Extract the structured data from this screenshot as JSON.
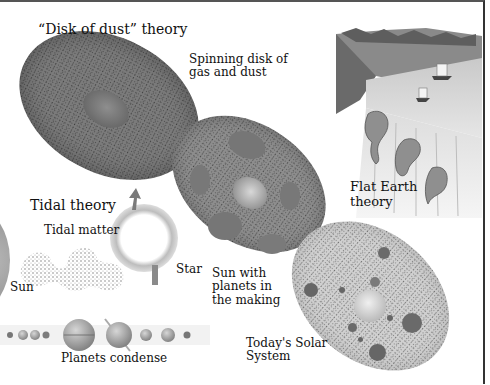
{
  "diagram": {
    "labels": {
      "disk_of_dust_theory": "“Disk of dust” theory",
      "spinning_disk_line1": "Spinning disk of",
      "spinning_disk_line2": "gas and dust",
      "tidal_theory": "Tidal theory",
      "tidal_matter": "Tidal matter",
      "sun": "Sun",
      "star": "Star",
      "sun_with_planets_line1": "Sun with",
      "sun_with_planets_line2": "planets in",
      "sun_with_planets_line3": "the making",
      "flat_earth_line1": "Flat Earth",
      "flat_earth_line2": "theory",
      "planets_condense": "Planets condense",
      "todays_solar_line1": "Today's Solar",
      "todays_solar_line2": "System"
    },
    "colors": {
      "disk_dark": "#6e6e6e",
      "disk_mid": "#8a8a8a",
      "disk_light": "#c8c8c8",
      "text": "#111111",
      "border": "#444444"
    },
    "icons": [
      "dust-disk",
      "protoplanet-disk",
      "solar-system-disk",
      "star-ring",
      "arrow-up-icon",
      "flat-earth-illustration",
      "planet-row"
    ]
  }
}
